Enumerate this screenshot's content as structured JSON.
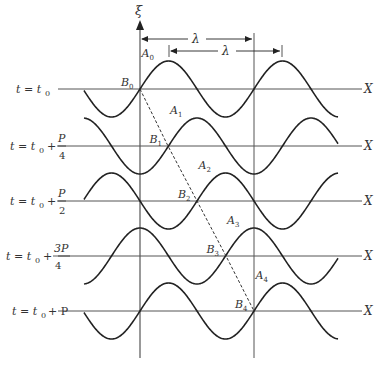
{
  "figure": {
    "vertical_axis_label": "ξ",
    "horizontal_axis_label": "X",
    "wavelength_label": "λ",
    "colors": {
      "line": "#222222",
      "axis": "#555555",
      "text": "#333333"
    }
  },
  "rows": [
    {
      "time_label": {
        "prefix": "t = t",
        "sub": "0",
        "frac_num": "",
        "frac_den": "",
        "suffix": ""
      },
      "A": "A",
      "A_sub": "0",
      "B": "B",
      "B_sub": "0",
      "phase_quarters": 0
    },
    {
      "time_label": {
        "prefix": "t = t",
        "sub": "0",
        "plus": "+",
        "frac_num": "P",
        "frac_den": "4"
      },
      "A": "A",
      "A_sub": "1",
      "B": "B",
      "B_sub": "1",
      "phase_quarters": 1
    },
    {
      "time_label": {
        "prefix": "t = t",
        "sub": "0",
        "plus": "+",
        "frac_num": "P",
        "frac_den": "2"
      },
      "A": "A",
      "A_sub": "2",
      "B": "B",
      "B_sub": "2",
      "phase_quarters": 2
    },
    {
      "time_label": {
        "prefix": "t = t",
        "sub": "0",
        "plus": "+",
        "frac_num": "3P",
        "frac_den": "4"
      },
      "A": "A",
      "A_sub": "3",
      "B": "B",
      "B_sub": "3",
      "phase_quarters": 3
    },
    {
      "time_label": {
        "prefix": "t = t",
        "sub": "0",
        "plus": "+ P"
      },
      "A": "A",
      "A_sub": "4",
      "B": "B",
      "B_sub": "4",
      "phase_quarters": 4
    }
  ]
}
